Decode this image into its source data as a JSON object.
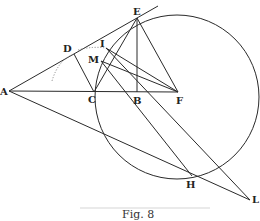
{
  "figure": {
    "caption": "Fig. 8",
    "points": {
      "A": {
        "label": "A",
        "x": 9,
        "y": 91
      },
      "C": {
        "label": "C",
        "x": 94,
        "y": 92
      },
      "B": {
        "label": "B",
        "x": 137,
        "y": 92
      },
      "F": {
        "label": "F",
        "x": 178,
        "y": 92
      },
      "E": {
        "label": "E",
        "x": 137,
        "y": 18
      },
      "D": {
        "label": "D",
        "x": 74,
        "y": 54
      },
      "I": {
        "label": "I",
        "x": 106,
        "y": 48
      },
      "M": {
        "label": "M",
        "x": 101,
        "y": 61
      },
      "H": {
        "label": "H",
        "x": 192,
        "y": 176
      },
      "L": {
        "label": "L",
        "x": 250,
        "y": 200
      }
    },
    "colors": {
      "ink": "#2a2a2a",
      "background": "#ffffff"
    }
  }
}
